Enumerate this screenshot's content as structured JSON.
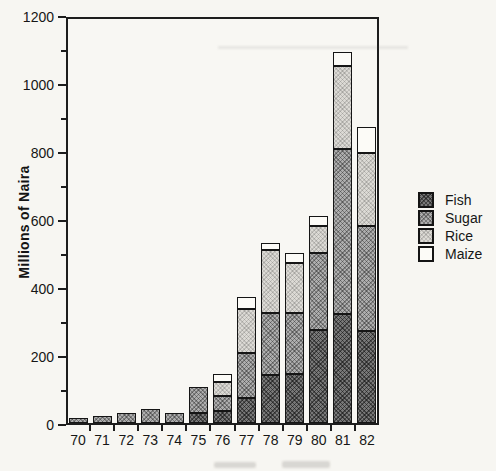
{
  "chart_data": {
    "type": "bar",
    "stacked": true,
    "title": "",
    "xlabel": "",
    "ylabel": "Millions of Naira",
    "ylim": [
      0,
      1200
    ],
    "y_major_step": 200,
    "y_minor_step": 100,
    "grid": false,
    "legend_position": "right",
    "categories": [
      "70",
      "71",
      "72",
      "73",
      "74",
      "75",
      "76",
      "77",
      "78",
      "79",
      "80",
      "81",
      "82"
    ],
    "series": [
      {
        "name": "Fish",
        "key": "fish",
        "color": "#6f6f6f",
        "values": [
          0,
          0,
          0,
          0,
          0,
          30,
          35,
          75,
          140,
          145,
          275,
          320,
          270
        ]
      },
      {
        "name": "Sugar",
        "key": "sugar",
        "color": "#a9a9a9",
        "values": [
          15,
          20,
          30,
          40,
          30,
          75,
          45,
          130,
          185,
          180,
          225,
          485,
          310
        ]
      },
      {
        "name": "Rice",
        "key": "rice",
        "color": "#d8d6d1",
        "values": [
          0,
          0,
          0,
          0,
          0,
          0,
          40,
          130,
          185,
          145,
          80,
          245,
          215
        ]
      },
      {
        "name": "Maize",
        "key": "maize",
        "color": "#fcfbf7",
        "values": [
          0,
          0,
          0,
          0,
          0,
          0,
          25,
          35,
          20,
          30,
          30,
          40,
          75
        ]
      }
    ],
    "stack_order_bottom_to_top": [
      "Fish",
      "Sugar",
      "Rice",
      "Maize"
    ],
    "totals": [
      15,
      20,
      30,
      40,
      30,
      105,
      145,
      370,
      530,
      500,
      610,
      1090,
      870
    ]
  },
  "axes": {
    "y_tick_labels": [
      "0",
      "200",
      "400",
      "600",
      "800",
      "1000",
      "1200"
    ]
  },
  "legend": {
    "items": [
      {
        "label": "Fish",
        "key": "fish"
      },
      {
        "label": "Sugar",
        "key": "sugar"
      },
      {
        "label": "Rice",
        "key": "rice"
      },
      {
        "label": "Maize",
        "key": "maize"
      }
    ]
  },
  "colors": {
    "axis": "#1d1d1d",
    "background": "#f7f6f2",
    "fish": "#6f6f6f",
    "sugar": "#a9a9a9",
    "rice": "#d8d6d1",
    "maize": "#fcfbf7"
  }
}
